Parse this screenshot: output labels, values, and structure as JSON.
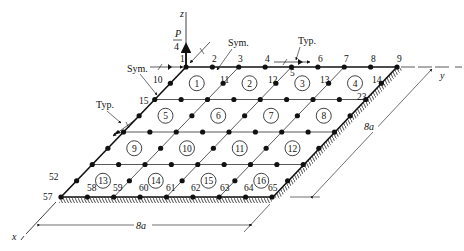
{
  "figure": {
    "axes": {
      "z": "z",
      "y": "y",
      "x": "x"
    },
    "load": {
      "numerator": "P",
      "denominator": "4"
    },
    "annotations": {
      "sym_top": "Sym.",
      "sym_left": "Sym.",
      "typ_top": "Typ.",
      "typ_left": "Typ."
    },
    "dimensions": {
      "right": "8a",
      "bottom": "8a"
    },
    "node_labels": [
      {
        "id": "1",
        "x": 180,
        "y": 62
      },
      {
        "id": "2",
        "x": 212,
        "y": 62
      },
      {
        "id": "3",
        "x": 238,
        "y": 62
      },
      {
        "id": "4",
        "x": 265,
        "y": 62
      },
      {
        "id": "5",
        "x": 290,
        "y": 76
      },
      {
        "id": "6",
        "x": 318,
        "y": 62
      },
      {
        "id": "7",
        "x": 344,
        "y": 62
      },
      {
        "id": "8",
        "x": 371,
        "y": 62
      },
      {
        "id": "9",
        "x": 397,
        "y": 62
      },
      {
        "id": "10",
        "x": 153,
        "y": 83
      },
      {
        "id": "11",
        "x": 220,
        "y": 83
      },
      {
        "id": "12",
        "x": 268,
        "y": 83
      },
      {
        "id": "13",
        "x": 320,
        "y": 83
      },
      {
        "id": "14",
        "x": 372,
        "y": 83
      },
      {
        "id": "15",
        "x": 139,
        "y": 104
      },
      {
        "id": "23",
        "x": 357,
        "y": 100
      },
      {
        "id": "52",
        "x": 49,
        "y": 180
      },
      {
        "id": "57",
        "x": 43,
        "y": 200
      },
      {
        "id": "58",
        "x": 87,
        "y": 191
      },
      {
        "id": "59",
        "x": 113,
        "y": 191
      },
      {
        "id": "60",
        "x": 139,
        "y": 191
      },
      {
        "id": "61",
        "x": 166,
        "y": 191
      },
      {
        "id": "62",
        "x": 191,
        "y": 191
      },
      {
        "id": "63",
        "x": 220,
        "y": 191
      },
      {
        "id": "64",
        "x": 244,
        "y": 191
      },
      {
        "id": "65",
        "x": 268,
        "y": 191
      }
    ],
    "elements": [
      "1",
      "2",
      "3",
      "4",
      "5",
      "6",
      "7",
      "8",
      "9",
      "10",
      "11",
      "12",
      "13",
      "14",
      "15",
      "16"
    ]
  }
}
